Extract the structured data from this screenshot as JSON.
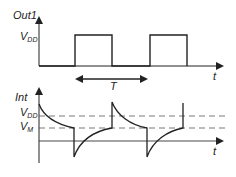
{
  "top_plot": {
    "y_label": "Out1",
    "level_label_main": "V",
    "level_label_sub": "DD",
    "x_label": "t",
    "period_label": "T"
  },
  "bottom_plot": {
    "y_label": "Int",
    "vdd_label_main": "V",
    "vdd_label_sub": "DD",
    "vm_label_main": "V",
    "vm_label_sub": "M",
    "x_label": "t"
  },
  "colors": {
    "stroke": "#222222",
    "dash": "#555555",
    "background": "#ffffff"
  }
}
